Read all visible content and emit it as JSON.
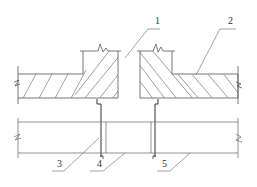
{
  "diagram": {
    "type": "construction-detail",
    "labels": [
      {
        "id": "1",
        "text": "1",
        "x": 155,
        "y": 24
      },
      {
        "id": "2",
        "text": "2",
        "x": 228,
        "y": 24
      },
      {
        "id": "3",
        "text": "3",
        "x": 57,
        "y": 165
      },
      {
        "id": "4",
        "text": "4",
        "x": 97,
        "y": 165
      },
      {
        "id": "5",
        "text": "5",
        "x": 162,
        "y": 165
      }
    ],
    "colors": {
      "line": "#444444",
      "thin": "#777777",
      "background": "#ffffff"
    }
  }
}
